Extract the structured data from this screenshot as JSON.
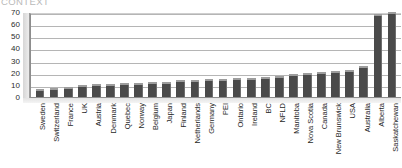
{
  "heading": "CONTEXT",
  "chart_data": {
    "type": "bar",
    "title": "",
    "xlabel": "",
    "ylabel": "",
    "ylim": [
      0,
      70
    ],
    "yticks": [
      70,
      60,
      50,
      40,
      30,
      20,
      10,
      0
    ],
    "grid": true,
    "legend": "none",
    "bar_color": "#4a4a4a",
    "categories": [
      "Sweden",
      "Switzerland",
      "France",
      "UK",
      "Austria",
      "Denmark",
      "Quebec",
      "Norway",
      "Belgium",
      "Japan",
      "Finland",
      "Netherlands",
      "Germany",
      "PEI",
      "Ontario",
      "Ireland",
      "BC",
      "NFLD",
      "Manitoba",
      "Nova Scotia",
      "Canada",
      "New Brunswick",
      "USA",
      "Australia",
      "Alberta",
      "Saskatchewan"
    ],
    "values": [
      5,
      6,
      7,
      8,
      9,
      9,
      10,
      10,
      11,
      11,
      12,
      12,
      13,
      13,
      14,
      14,
      15,
      16,
      17,
      18,
      19,
      20,
      21,
      24,
      67,
      68
    ]
  }
}
